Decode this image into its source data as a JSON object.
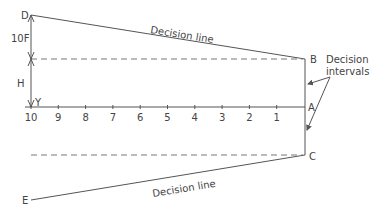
{
  "diagram": {
    "points": {
      "D": "D",
      "B": "B",
      "A": "A",
      "C": "C",
      "E": "E",
      "Y": "Y"
    },
    "dimension_labels": {
      "upper": "10F",
      "lower": "H"
    },
    "upper_line_label": "Decision line",
    "lower_line_label": "Decision line",
    "annotation": {
      "line1": "Decision",
      "line2": "intervals"
    },
    "axis_ticks": [
      "10",
      "9",
      "8",
      "7",
      "6",
      "5",
      "4",
      "3",
      "2",
      "1"
    ]
  }
}
